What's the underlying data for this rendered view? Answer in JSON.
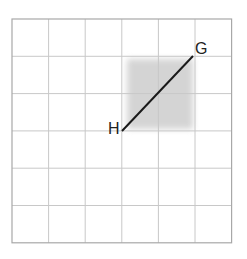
{
  "diagram": {
    "grid": {
      "cols": 6,
      "rows": 6,
      "origin": [
        12,
        19
      ],
      "cell_w": 36.6,
      "cell_h": 37.3,
      "line_color": "#c8c8c8",
      "border_color": "#a8a8a8"
    },
    "shaded_region": {
      "col": 3,
      "row": 1,
      "width_cells": 2,
      "height_cells": 2,
      "color": "#d6d6d6"
    },
    "segment": {
      "from_label": "H",
      "to_label": "G",
      "from_grid": [
        3,
        3
      ],
      "to_grid": [
        5,
        1
      ],
      "color": "#1a1a1a"
    },
    "labels": {
      "G": "G",
      "H": "H"
    }
  }
}
